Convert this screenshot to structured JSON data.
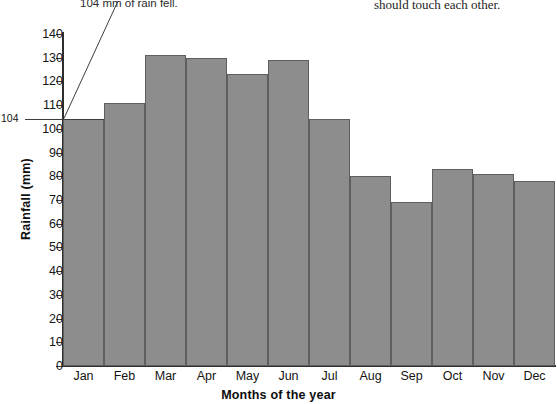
{
  "annotations": {
    "left_note": "104 mm of rain fell.",
    "right_note": "should touch each other."
  },
  "callout": {
    "value_label": "104"
  },
  "chart_data": {
    "type": "bar",
    "title": "",
    "xlabel": "Months of the year",
    "ylabel": "Rainfall (mm)",
    "categories": [
      "Jan",
      "Feb",
      "Mar",
      "Apr",
      "May",
      "Jun",
      "Jul",
      "Aug",
      "Sep",
      "Oct",
      "Nov",
      "Dec"
    ],
    "values": [
      104,
      111,
      131,
      130,
      123,
      129,
      104,
      80,
      69,
      83,
      81,
      78
    ],
    "ylim": [
      0,
      140
    ],
    "ytick_labels": [
      "0",
      "10",
      "20",
      "30",
      "40",
      "50",
      "60",
      "70",
      "80",
      "90",
      "100",
      "110",
      "120",
      "130",
      "140"
    ],
    "ytick_values": [
      0,
      10,
      20,
      30,
      40,
      50,
      60,
      70,
      80,
      90,
      100,
      110,
      120,
      130,
      140
    ],
    "grid": false,
    "legend": null,
    "bar_color": "#8d8d8d",
    "bar_border_color": "#5e5e5e",
    "axis_color": "#2e2e2e"
  }
}
